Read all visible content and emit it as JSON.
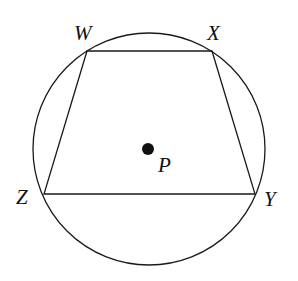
{
  "diagram": {
    "type": "inscribed-quadrilateral",
    "circle": {
      "center": [
        149,
        149
      ],
      "radius": 116,
      "center_label": "P"
    },
    "vertices": [
      {
        "label": "W",
        "x": 87,
        "y": 51,
        "label_x": 74,
        "label_y": 40
      },
      {
        "label": "X",
        "x": 212,
        "y": 51,
        "label_x": 207,
        "label_y": 40
      },
      {
        "label": "Y",
        "x": 255,
        "y": 194,
        "label_x": 264,
        "label_y": 206
      },
      {
        "label": "Z",
        "x": 44,
        "y": 194,
        "label_x": 16,
        "label_y": 204
      }
    ],
    "center_point": {
      "label": "P",
      "x": 148,
      "y": 149,
      "label_x": 158,
      "label_y": 172
    },
    "colors": {
      "stroke": "#1a1a1a",
      "background": "#ffffff"
    }
  }
}
